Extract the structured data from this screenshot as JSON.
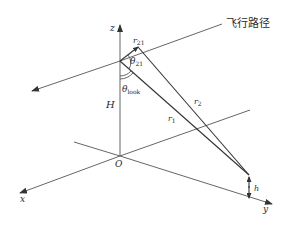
{
  "diagram": {
    "labels": {
      "flight_path": "飞行路径",
      "z_axis": "z",
      "x_axis": "x",
      "y_axis": "y",
      "origin": "O",
      "height_H": "H",
      "r21_main": "r",
      "r21_sub": "21",
      "theta21_main": "θ",
      "theta21_sub": "21",
      "thetalook_main": "θ",
      "thetalook_sub": "look",
      "r1_main": "r",
      "r1_sub": "1",
      "r2_main": "r",
      "r2_sub": "2",
      "h_label": "h"
    },
    "colors": {
      "line": "#555555",
      "text": "#2a2a2a",
      "background": "#ffffff"
    }
  }
}
